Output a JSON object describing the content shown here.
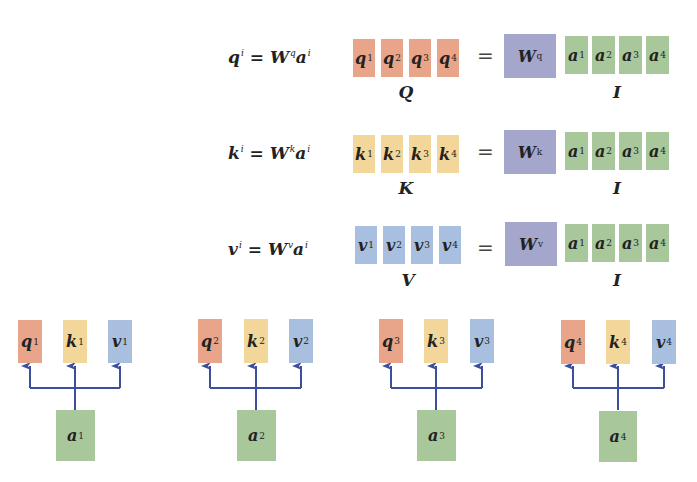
{
  "colors": {
    "query": "#e8a58a",
    "key": "#f3d79a",
    "value": "#a9bfdf",
    "weight": "#a4a6cc",
    "input": "#a8c79a",
    "arrow": "#3d4f9a"
  },
  "equations": [
    {
      "id": "query",
      "lhs": "q",
      "lhs_sup": "i",
      "eqsign": "=",
      "w": "W",
      "w_sup": "q",
      "a": "a",
      "a_sup": "i",
      "matrix_blocks": [
        {
          "sym": "q",
          "sup": "1"
        },
        {
          "sym": "q",
          "sup": "2"
        },
        {
          "sym": "q",
          "sup": "3"
        },
        {
          "sym": "q",
          "sup": "4"
        }
      ],
      "matrix_label": "Q",
      "equals": "=",
      "weight_block": {
        "sym": "W",
        "sup": "q"
      },
      "input_blocks": [
        {
          "sym": "a",
          "sup": "1"
        },
        {
          "sym": "a",
          "sup": "2"
        },
        {
          "sym": "a",
          "sup": "3"
        },
        {
          "sym": "a",
          "sup": "4"
        }
      ],
      "input_label": "I"
    },
    {
      "id": "key",
      "lhs": "k",
      "lhs_sup": "i",
      "eqsign": "=",
      "w": "W",
      "w_sup": "k",
      "a": "a",
      "a_sup": "i",
      "matrix_blocks": [
        {
          "sym": "k",
          "sup": "1"
        },
        {
          "sym": "k",
          "sup": "2"
        },
        {
          "sym": "k",
          "sup": "3"
        },
        {
          "sym": "k",
          "sup": "4"
        }
      ],
      "matrix_label": "K",
      "equals": "=",
      "weight_block": {
        "sym": "W",
        "sup": "k"
      },
      "input_blocks": [
        {
          "sym": "a",
          "sup": "1"
        },
        {
          "sym": "a",
          "sup": "2"
        },
        {
          "sym": "a",
          "sup": "3"
        },
        {
          "sym": "a",
          "sup": "4"
        }
      ],
      "input_label": "I"
    },
    {
      "id": "value",
      "lhs": "v",
      "lhs_sup": "i",
      "eqsign": "=",
      "w": "W",
      "w_sup": "v",
      "a": "a",
      "a_sup": "i",
      "matrix_blocks": [
        {
          "sym": "v",
          "sup": "1"
        },
        {
          "sym": "v",
          "sup": "2"
        },
        {
          "sym": "v",
          "sup": "3"
        },
        {
          "sym": "v",
          "sup": "4"
        }
      ],
      "matrix_label": "V",
      "equals": "=",
      "weight_block": {
        "sym": "W",
        "sup": "v"
      },
      "input_blocks": [
        {
          "sym": "a",
          "sup": "1"
        },
        {
          "sym": "a",
          "sup": "2"
        },
        {
          "sym": "a",
          "sup": "3"
        },
        {
          "sym": "a",
          "sup": "4"
        }
      ],
      "input_label": "I"
    }
  ],
  "token_groups": [
    {
      "input": {
        "sym": "a",
        "sup": "1"
      },
      "outputs": [
        {
          "sym": "q",
          "sup": "1"
        },
        {
          "sym": "k",
          "sup": "1"
        },
        {
          "sym": "v",
          "sup": "1"
        }
      ]
    },
    {
      "input": {
        "sym": "a",
        "sup": "2"
      },
      "outputs": [
        {
          "sym": "q",
          "sup": "2"
        },
        {
          "sym": "k",
          "sup": "2"
        },
        {
          "sym": "v",
          "sup": "2"
        }
      ]
    },
    {
      "input": {
        "sym": "a",
        "sup": "3"
      },
      "outputs": [
        {
          "sym": "q",
          "sup": "3"
        },
        {
          "sym": "k",
          "sup": "3"
        },
        {
          "sym": "v",
          "sup": "3"
        }
      ]
    },
    {
      "input": {
        "sym": "a",
        "sup": "4"
      },
      "outputs": [
        {
          "sym": "q",
          "sup": "4"
        },
        {
          "sym": "k",
          "sup": "4"
        },
        {
          "sym": "v",
          "sup": "4"
        }
      ]
    }
  ]
}
